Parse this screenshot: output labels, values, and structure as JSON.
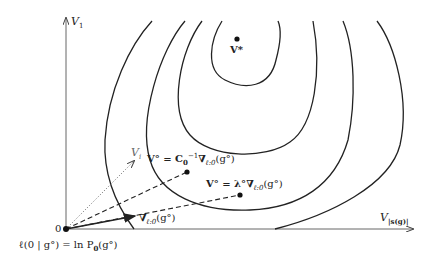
{
  "axes": {
    "y_label": "V",
    "y_sub": "1",
    "x_label": "V",
    "x_sub": "|s(g)|",
    "origin_label": "0",
    "diag_label": "V",
    "diag_sub": "i"
  },
  "points": {
    "optimum": {
      "label": "V*"
    },
    "newton": {
      "label_lhs": "V° = ",
      "label_C": "C",
      "label_C_sub": "0",
      "label_C_sup": "−1",
      "label_rhs": "∇",
      "label_rhs_sub": "ℓ:0",
      "label_arg": "(g°)"
    },
    "gradient_scaled": {
      "label_lhs": "V° = λ°",
      "label_rhs": "∇",
      "label_rhs_sub": "ℓ:0",
      "label_arg": "(g°)"
    }
  },
  "gradient_arrow": {
    "label": "∇",
    "label_sub": "ℓ:0",
    "label_arg": "(g°)"
  },
  "origin_equation": {
    "lhs": "ℓ(0 | g°) = ln P",
    "sub": "0",
    "rhs": "(g°)"
  },
  "colors": {
    "ink": "#222222",
    "axis": "#555555"
  }
}
